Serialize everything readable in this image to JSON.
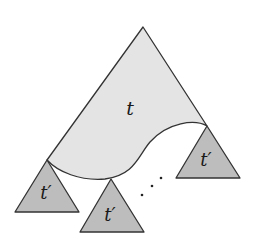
{
  "diagram": {
    "type": "tree-decomposition",
    "colors": {
      "background": "#ffffff",
      "big_tree_fill": "#e4e4e4",
      "subtree_fill": "#bdbdbd",
      "stroke": "#333333",
      "text": "#1a1a1a"
    },
    "big_tree": {
      "label": "t",
      "apex": [
        143,
        27
      ],
      "left_corner": [
        47,
        160
      ],
      "right_corner": [
        207,
        126
      ]
    },
    "subtrees": [
      {
        "label": "t′",
        "apex": [
          47,
          160
        ],
        "base_left": [
          15,
          212
        ],
        "base_right": [
          79,
          212
        ]
      },
      {
        "label": "t′",
        "apex": [
          111,
          179
        ],
        "base_left": [
          80,
          232
        ],
        "base_right": [
          144,
          232
        ]
      },
      {
        "label": "t′",
        "apex": [
          207,
          126
        ],
        "base_left": [
          176,
          178
        ],
        "base_right": [
          240,
          178
        ]
      }
    ],
    "ellipsis": {
      "text": "⋰",
      "dots": [
        [
          142,
          195
        ],
        [
          152,
          186
        ],
        [
          161,
          178
        ]
      ]
    }
  }
}
